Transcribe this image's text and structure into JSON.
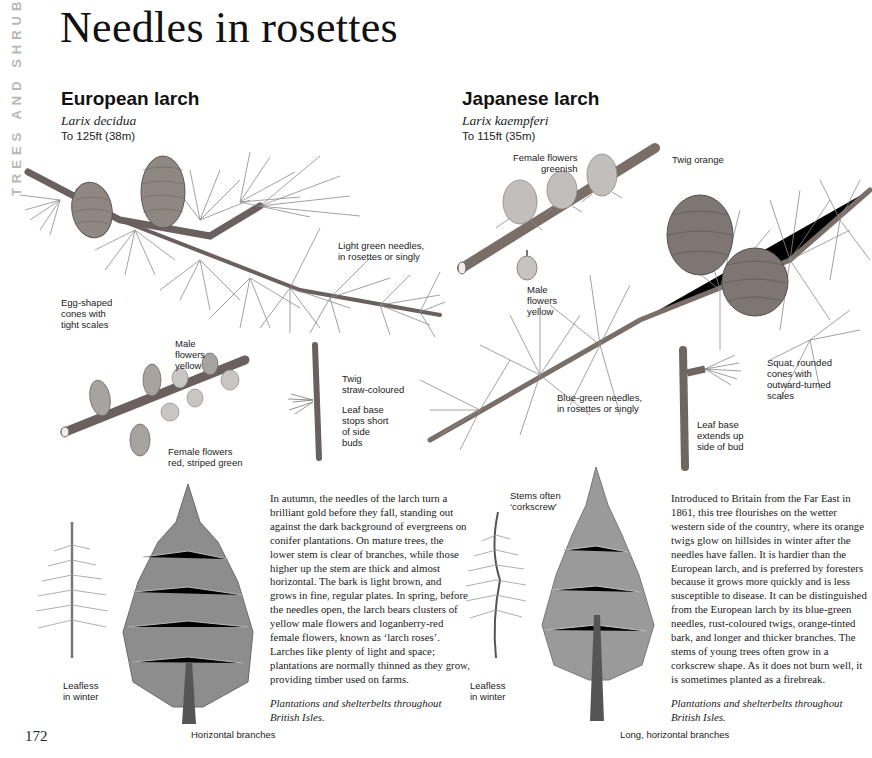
{
  "page": {
    "section_tab": "TREES AND SHRUBS",
    "title": "Needles in rosettes",
    "page_number": "172"
  },
  "species": [
    {
      "name": "European larch",
      "latin": "Larix decidua",
      "height": "To 125ft (38m)",
      "labels": {
        "cones": "Egg-shaped\ncones with\ntight scales",
        "needles": "Light green needles,\nin rosettes or singly",
        "male_flowers": "Male\nflowers\nyellow",
        "female_flowers": "Female flowers\nred, striped green",
        "twig": "Twig\nstraw-coloured",
        "leaf_base": "Leaf base\nstops short\nof side\nbuds",
        "winter": "Leafless\nin winter",
        "branches": "Horizontal branches"
      },
      "description": "In autumn, the needles of the larch turn a brilliant gold before they fall, standing out against the dark background of evergreens on conifer plantations. On mature trees, the lower stem is clear of branches, while those higher up the stem are thick and almost horizontal. The bark is light brown, and grows in fine, regular plates. In spring, before the needles open, the larch bears clusters of yellow male flowers and loganberry-red female flowers, known as ‘larch roses’. Larches like plenty of light and space; plantations are normally thinned as they grow, providing timber used on farms.",
      "range": "Plantations and shelterbelts throughout British Isles."
    },
    {
      "name": "Japanese larch",
      "latin": "Larix kaempferi",
      "height": "To 115ft (35m)",
      "labels": {
        "female_flowers": "Female flowers\ngreenish",
        "twig": "Twig orange",
        "male_flowers": "Male\nflowers\nyellow",
        "needles": "Blue-green needles,\nin rosettes or singly",
        "cones": "Squat, rounded\ncones with\noutward-turned\nscales",
        "leaf_base": "Leaf base\nextends up\nside of bud",
        "stems": "Stems often\n‘corkscrew’",
        "winter": "Leafless\nin winter",
        "branches": "Long, horizontal branches"
      },
      "description": "Introduced to Britain from the Far East in 1861, this tree flourishes on the wetter western side of the country, where its orange twigs glow on hillsides in winter after the needles have fallen. It is hardier than the European larch, and is preferred by foresters because it grows more quickly and is less susceptible to disease. It can be distinguished from the European larch by its blue-green needles, rust-coloured twigs, orange-tinted bark, and longer and thicker branches. The stems of young trees often grow in a corkscrew shape. As it does not burn well, it is sometimes planted as a firebreak.",
      "range": "Plantations and shelterbelts throughout British Isles."
    }
  ],
  "colors": {
    "ink": "#111111",
    "illustration": "#6f6f6f",
    "side_tab": "#b8b8b8"
  }
}
